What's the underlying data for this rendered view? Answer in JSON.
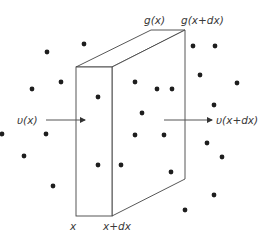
{
  "diagram": {
    "type": "control-volume slab with particles",
    "labels": {
      "top_back_left": "g(x)",
      "top_back_right": "g(x+dx)",
      "inflow": "υ(x)",
      "outflow": "υ(x+dx)",
      "bottom_left": "x",
      "bottom_right": "x+dx"
    },
    "colors": {
      "line": "#444444",
      "dot": "#1e1e1e",
      "text": "#3a3a3a",
      "background": "#ffffff"
    },
    "box": {
      "front_face": {
        "x1": 76,
        "y1": 67,
        "x2": 112,
        "y2": 216
      },
      "back_top_left": [
        151,
        30
      ],
      "back_top_right": [
        185,
        30
      ],
      "back_bottom_right": [
        185,
        179
      ]
    },
    "arrows": [
      {
        "name": "inflow-arrow",
        "from": [
          46,
          120
        ],
        "to": [
          85,
          120
        ]
      },
      {
        "name": "outflow-arrow",
        "from": [
          164,
          120
        ],
        "to": [
          212,
          120
        ]
      }
    ],
    "particles": [
      [
        47,
        52
      ],
      [
        84,
        44
      ],
      [
        32,
        89
      ],
      [
        61,
        82
      ],
      [
        98,
        97
      ],
      [
        2,
        134
      ],
      [
        46,
        134
      ],
      [
        24,
        156
      ],
      [
        98,
        165
      ],
      [
        53,
        186
      ],
      [
        135,
        82
      ],
      [
        157,
        89
      ],
      [
        172,
        89
      ],
      [
        142,
        113
      ],
      [
        135,
        135
      ],
      [
        164,
        135
      ],
      [
        121,
        165
      ],
      [
        171,
        172
      ],
      [
        193,
        46
      ],
      [
        215,
        46
      ],
      [
        200,
        75
      ],
      [
        237,
        83
      ],
      [
        214,
        105
      ],
      [
        207,
        143
      ],
      [
        222,
        157
      ],
      [
        214,
        195
      ],
      [
        185,
        210
      ]
    ]
  }
}
